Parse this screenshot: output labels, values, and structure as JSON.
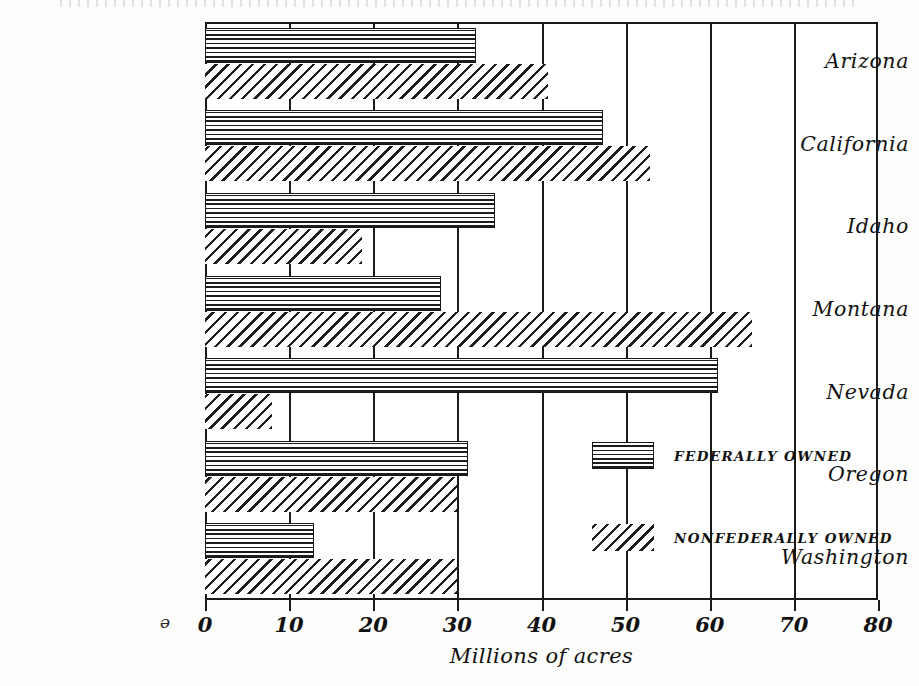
{
  "chart_data": {
    "type": "bar",
    "orientation": "horizontal",
    "title": "",
    "xlabel": "Millions of acres",
    "ylabel": "",
    "xlim": [
      0,
      80
    ],
    "xticks": [
      0,
      10,
      20,
      30,
      40,
      50,
      60,
      70,
      80
    ],
    "xtick_labels": [
      "0",
      "10",
      "20",
      "30",
      "40",
      "50",
      "60",
      "70",
      "80"
    ],
    "grid": "vertical",
    "legend_position": "inside-right",
    "categories": [
      "Arizona",
      "California",
      "Idaho",
      "Montana",
      "Nevada",
      "Oregon",
      "Washington"
    ],
    "series": [
      {
        "name": "FEDERALLY OWNED",
        "pattern": "horizontal-hatch",
        "values": [
          32.2,
          47.3,
          34.5,
          28.0,
          61.0,
          31.3,
          12.9
        ]
      },
      {
        "name": "NONFEDERALLY OWNED",
        "pattern": "diagonal-hatch",
        "values": [
          40.8,
          52.9,
          18.7,
          65.0,
          8.0,
          30.0,
          30.0
        ]
      }
    ]
  },
  "axis": {
    "x_title": "Millions of acres",
    "tick_labels": [
      "0",
      "10",
      "20",
      "30",
      "40",
      "50",
      "60",
      "70",
      "80"
    ]
  },
  "categories": [
    {
      "label": "Arizona"
    },
    {
      "label": "California"
    },
    {
      "label": "Idaho"
    },
    {
      "label": "Montana"
    },
    {
      "label": "Nevada"
    },
    {
      "label": "Oregon"
    },
    {
      "label": "Washington"
    }
  ],
  "legend": {
    "items": [
      {
        "label": "FEDERALLY OWNED",
        "pattern": "horizontal-hatch"
      },
      {
        "label": "NONFEDERALLY OWNED",
        "pattern": "diagonal-hatch"
      }
    ]
  },
  "marks": {
    "corner_symbol": "ə"
  },
  "colors": {
    "ink": "#1a1a1a",
    "paper": "#fdfdfb",
    "plot_background": "#ffffff"
  }
}
